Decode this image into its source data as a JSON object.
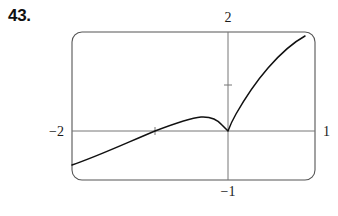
{
  "problem": {
    "number": "43."
  },
  "figure": {
    "frame": {
      "shape": "rounded-rectangle",
      "x": 72,
      "y": 32,
      "width": 243,
      "height": 148,
      "corner_radius": 10,
      "stroke": "#555555"
    },
    "axes": {
      "origin": {
        "x": 228,
        "y": 131
      },
      "x_axis": {
        "x1": 72,
        "y1": 131,
        "x2": 315,
        "y2": 131,
        "stroke": "#777777"
      },
      "y_axis": {
        "x1": 228,
        "y1": 32,
        "x2": 228,
        "y2": 180,
        "stroke": "#777777"
      },
      "ticks": [
        {
          "name": "x-tick",
          "x": 155,
          "y": 131
        },
        {
          "name": "y-tick",
          "x": 228,
          "y": 85
        }
      ]
    },
    "labels": {
      "top": "2",
      "left": "−2",
      "right": "1",
      "bottom": "−1"
    },
    "curve": {
      "stroke": "#111111",
      "stroke_width": 1.5,
      "description": "cusp at origin; rises from lower-left, local maximum left of origin, cusp down at origin, steep rise to upper-right",
      "path": "M 72 165 C 96 157 124 144 155 131 C 176 123 190 118 201 117 C 210 116.5 217 119 222 125 C 225 128 227 130 228 131 C 229.5 127 232 121 236 114 C 244 100 255 83 268 68 C 281 53 294 42 305 36"
    }
  },
  "colors": {
    "ink": "#111111",
    "axis": "#777777",
    "frame": "#555555",
    "background": "#ffffff"
  }
}
